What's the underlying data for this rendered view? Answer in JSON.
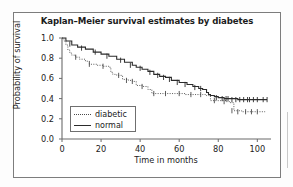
{
  "figure": {
    "title": "Kaplan–Meier survival estimates by diabetes",
    "background": "#ffffff",
    "frame_color": "#7d7d7d"
  },
  "axes": {
    "xlabel": "Time in months",
    "ylabel": "Probability of survival",
    "xticks": [
      "0",
      "20",
      "40",
      "60",
      "80",
      "100"
    ],
    "yticks": [
      "0.0",
      "0.2",
      "0.4",
      "0.6",
      "0.8",
      "1.0"
    ]
  },
  "legend": {
    "items": [
      {
        "label": "diabetic",
        "style": "dotted",
        "color": "#4a4a4a"
      },
      {
        "label": "normal",
        "style": "solid",
        "color": "#2b2b2b"
      }
    ]
  },
  "chart_data": {
    "type": "line",
    "title": "Kaplan–Meier survival estimates by diabetes",
    "xlabel": "Time in months",
    "ylabel": "Probability of survival",
    "xlim": [
      0,
      107
    ],
    "ylim": [
      0,
      1.0
    ],
    "xticks": [
      0,
      20,
      40,
      60,
      80,
      100
    ],
    "yticks": [
      0.0,
      0.2,
      0.4,
      0.6,
      0.8,
      1.0
    ],
    "grid": false,
    "legend_position": "lower-left-inside",
    "series": [
      {
        "name": "diabetic",
        "style": "dotted",
        "color": "#4a4a4a",
        "step": "post",
        "x": [
          0,
          1,
          2,
          3,
          4,
          5,
          7,
          9,
          12,
          14,
          18,
          21,
          24,
          25,
          26,
          28,
          31,
          34,
          36,
          38,
          41,
          44,
          46,
          52,
          58,
          63,
          68,
          72,
          74,
          76,
          80,
          84,
          86,
          88,
          92,
          96,
          100,
          104
        ],
        "y": [
          1.0,
          0.97,
          0.93,
          0.88,
          0.85,
          0.83,
          0.81,
          0.79,
          0.77,
          0.74,
          0.73,
          0.72,
          0.71,
          0.66,
          0.64,
          0.63,
          0.59,
          0.58,
          0.57,
          0.53,
          0.52,
          0.49,
          0.45,
          0.45,
          0.45,
          0.44,
          0.44,
          0.44,
          0.43,
          0.38,
          0.38,
          0.37,
          0.36,
          0.28,
          0.27,
          0.27,
          0.27,
          0.27
        ],
        "censor_x": [
          7,
          14,
          21,
          29,
          33,
          36,
          41,
          47,
          53,
          60,
          66,
          71,
          78,
          83,
          87,
          90,
          94,
          97,
          100
        ],
        "censor_y": [
          0.81,
          0.74,
          0.72,
          0.63,
          0.58,
          0.57,
          0.52,
          0.45,
          0.45,
          0.45,
          0.44,
          0.44,
          0.38,
          0.37,
          0.28,
          0.27,
          0.27,
          0.27,
          0.27
        ]
      },
      {
        "name": "normal",
        "style": "solid",
        "color": "#2b2b2b",
        "step": "post",
        "x": [
          0,
          2,
          5,
          8,
          12,
          16,
          20,
          24,
          28,
          32,
          36,
          38,
          41,
          44,
          47,
          50,
          53,
          56,
          60,
          64,
          67,
          70,
          72,
          73,
          74,
          75,
          76,
          78,
          80,
          83,
          86,
          90,
          94,
          98,
          102,
          105
        ],
        "y": [
          1.0,
          0.97,
          0.93,
          0.91,
          0.89,
          0.86,
          0.84,
          0.82,
          0.79,
          0.76,
          0.73,
          0.71,
          0.69,
          0.67,
          0.64,
          0.62,
          0.61,
          0.58,
          0.56,
          0.54,
          0.52,
          0.5,
          0.49,
          0.49,
          0.46,
          0.44,
          0.43,
          0.42,
          0.41,
          0.4,
          0.4,
          0.39,
          0.39,
          0.39,
          0.39,
          0.39
        ],
        "censor_x": [
          4,
          10,
          17,
          23,
          30,
          35,
          40,
          45,
          49,
          52,
          55,
          59,
          63,
          68,
          71,
          79,
          82,
          84,
          85,
          87,
          89,
          91,
          93,
          95,
          96,
          98,
          100,
          103,
          105
        ],
        "censor_y": [
          0.94,
          0.9,
          0.86,
          0.82,
          0.78,
          0.73,
          0.7,
          0.66,
          0.63,
          0.61,
          0.59,
          0.56,
          0.54,
          0.51,
          0.5,
          0.41,
          0.4,
          0.4,
          0.4,
          0.39,
          0.39,
          0.39,
          0.39,
          0.39,
          0.39,
          0.39,
          0.39,
          0.39,
          0.39
        ]
      }
    ]
  }
}
